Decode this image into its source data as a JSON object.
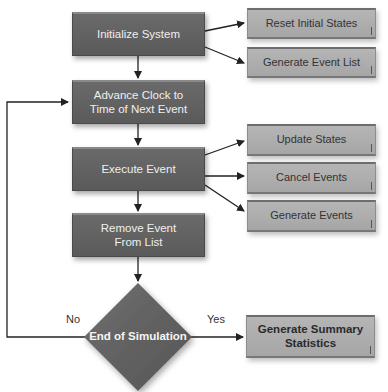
{
  "diagram": {
    "type": "flowchart",
    "main_flow": [
      {
        "id": "init",
        "label": "Initialize System"
      },
      {
        "id": "advance",
        "label": "Advance Clock to Time of Next Event",
        "lines": [
          "Advance Clock to",
          "Time of Next Event"
        ]
      },
      {
        "id": "execute",
        "label": "Execute Event"
      },
      {
        "id": "remove",
        "label": "Remove Event From List",
        "lines": [
          "Remove Event",
          "From List"
        ]
      },
      {
        "id": "decision",
        "label": "End of Simulation",
        "shape": "diamond"
      }
    ],
    "init_substeps": [
      "Reset Initial States",
      "Generate Event List"
    ],
    "execute_substeps": [
      "Update States",
      "Cancel Events",
      "Generate Events"
    ],
    "summary": {
      "label": "Generate Summary Statistics",
      "lines": [
        "Generate Summary",
        "Statistics"
      ]
    },
    "branches": {
      "no": "No",
      "yes": "Yes"
    },
    "edges": [
      [
        "Initialize System",
        "Reset Initial States"
      ],
      [
        "Initialize System",
        "Generate Event List"
      ],
      [
        "Initialize System",
        "Advance Clock to Time of Next Event"
      ],
      [
        "Advance Clock to Time of Next Event",
        "Execute Event"
      ],
      [
        "Execute Event",
        "Update States"
      ],
      [
        "Execute Event",
        "Cancel Events"
      ],
      [
        "Execute Event",
        "Generate Events"
      ],
      [
        "Execute Event",
        "Remove Event From List"
      ],
      [
        "Remove Event From List",
        "End of Simulation"
      ],
      [
        "End of Simulation",
        "Advance Clock to Time of Next Event",
        "No"
      ],
      [
        "End of Simulation",
        "Generate Summary Statistics",
        "Yes"
      ]
    ],
    "colors": {
      "dark_box": "#5f5f5f",
      "light_box": "#adadad",
      "line": "#222222"
    }
  }
}
